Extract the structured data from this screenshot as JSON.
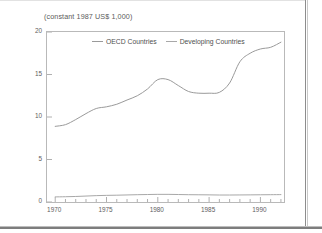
{
  "chart_data": {
    "type": "line",
    "title": "(constant 1987 US$ 1,000)",
    "xlabel": "",
    "ylabel": "",
    "xlim": [
      1969.2,
      1992.3
    ],
    "ylim": [
      0,
      20
    ],
    "grid": false,
    "legend_position": "top-center",
    "y_ticks": [
      "0",
      "5",
      "10",
      "15",
      "20"
    ],
    "y_tick_values": [
      0,
      5,
      10,
      15,
      20
    ],
    "x_ticks": [
      "1970",
      "1975",
      "1980",
      "1985",
      "1990"
    ],
    "x_tick_values": [
      1970,
      1975,
      1980,
      1985,
      1990
    ],
    "x": [
      1970,
      1971,
      1972,
      1973,
      1974,
      1975,
      1976,
      1977,
      1978,
      1979,
      1980,
      1981,
      1982,
      1983,
      1984,
      1985,
      1986,
      1987,
      1988,
      1989,
      1990,
      1991,
      1992
    ],
    "series": [
      {
        "name": "OECD Countries",
        "color": "#9a9a9a",
        "values": [
          8.9,
          9.1,
          9.7,
          10.4,
          11.0,
          11.2,
          11.5,
          12.0,
          12.5,
          13.3,
          14.4,
          14.4,
          13.7,
          13.0,
          12.8,
          12.8,
          12.9,
          14.0,
          16.5,
          17.5,
          18.0,
          18.2,
          18.8
        ]
      },
      {
        "name": "Developing Countries",
        "color": "#a8a8a8",
        "values": [
          0.6,
          0.62,
          0.65,
          0.7,
          0.75,
          0.78,
          0.8,
          0.83,
          0.86,
          0.88,
          0.9,
          0.9,
          0.88,
          0.86,
          0.85,
          0.84,
          0.82,
          0.82,
          0.83,
          0.84,
          0.85,
          0.86,
          0.87
        ]
      }
    ]
  },
  "legend": {
    "items": [
      {
        "label": "OECD Countries"
      },
      {
        "label": "Developing Countries"
      }
    ]
  }
}
